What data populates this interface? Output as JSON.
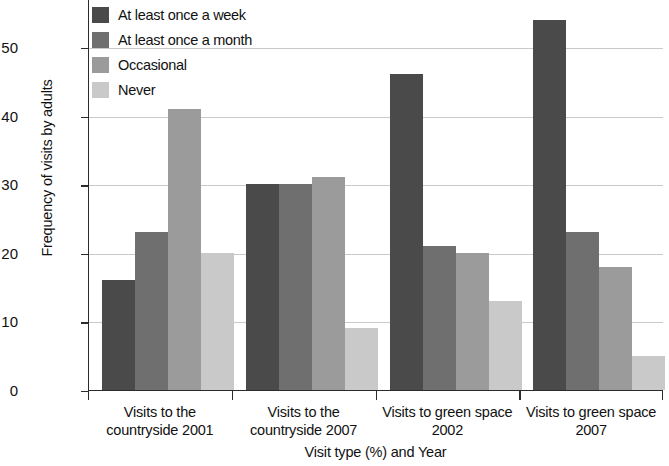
{
  "chart_data": {
    "type": "bar",
    "title": "",
    "xlabel": "Visit type (%) and Year",
    "ylabel": "Frequency of visits by adults",
    "ylim": [
      0,
      57
    ],
    "yticks": [
      0,
      10,
      20,
      30,
      40,
      50
    ],
    "ytick_labels": [
      "0",
      "10",
      "20",
      "30",
      "40",
      "50"
    ],
    "grid": "horizontal",
    "legend_position": "top-left-inside",
    "categories": [
      "Visits to the countryside 2001",
      "Visits to the countryside 2007",
      "Visits to green space 2002",
      "Visits to green space 2007"
    ],
    "category_lines": [
      [
        "Visits to the",
        "countryside 2001"
      ],
      [
        "Visits to the",
        "countryside 2007"
      ],
      [
        "Visits to green space",
        "2002"
      ],
      [
        "Visits to green space",
        "2007"
      ]
    ],
    "series": [
      {
        "name": "At least once a week",
        "color": "#4a4a4a",
        "values": [
          16,
          30,
          46,
          54
        ]
      },
      {
        "name": "At least once a month",
        "color": "#6f6f6f",
        "values": [
          23,
          30,
          21,
          23
        ]
      },
      {
        "name": "Occasional",
        "color": "#9b9b9b",
        "values": [
          41,
          31,
          20,
          18
        ]
      },
      {
        "name": "Never",
        "color": "#c9c9c9",
        "values": [
          20,
          9,
          13,
          5
        ]
      }
    ]
  },
  "axes": {
    "y_title": "Frequency of visits by adults",
    "x_title": "Visit type (%) and Year",
    "y_tick_0": "0",
    "y_tick_1": "10",
    "y_tick_2": "20",
    "y_tick_3": "30",
    "y_tick_4": "40",
    "y_tick_5": "50"
  },
  "legend": {
    "items": [
      {
        "label": "At least once a week"
      },
      {
        "label": "At least once a month"
      },
      {
        "label": "Occasional"
      },
      {
        "label": "Never"
      }
    ]
  },
  "categories": {
    "c0_line1": "Visits to the",
    "c0_line2": "countryside 2001",
    "c1_line1": "Visits to the",
    "c1_line2": "countryside 2007",
    "c2_line1": "Visits to green space",
    "c2_line2": "2002",
    "c3_line1": "Visits to green space",
    "c3_line2": "2007"
  }
}
